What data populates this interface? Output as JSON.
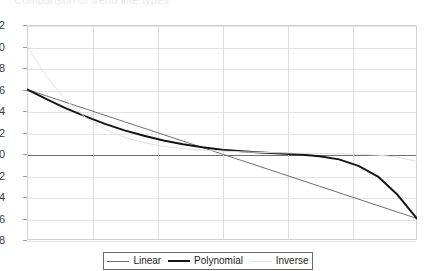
{
  "title": {
    "text": "Comparison of trend line types",
    "clipped": true
  },
  "legend": {
    "position": "bottom-center",
    "entries": [
      {
        "label": "Linear",
        "swatch": "linear-line-swatch",
        "color": "#6e6e72"
      },
      {
        "label": "Polynomial",
        "swatch": "poly-line-swatch",
        "color": "#151515"
      },
      {
        "label": "Inverse",
        "swatch": "inverse-line-swatch",
        "color": "#e2e2e6"
      }
    ]
  },
  "axis": {
    "y_ticks": [
      "12",
      "10",
      "8",
      "6",
      "4",
      "2",
      "0",
      "-2",
      "-4",
      "-6",
      "-8"
    ]
  },
  "chart_data": {
    "type": "line",
    "title": "Comparison of trend line types",
    "xlabel": "",
    "ylabel": "",
    "ylim": [
      -8,
      12
    ],
    "xlim": [
      0,
      6
    ],
    "ytick_step": 2,
    "yticks": [
      12,
      10,
      8,
      6,
      4,
      2,
      0,
      -2,
      -4,
      -6,
      -8
    ],
    "xticks": [
      0,
      1,
      2,
      3,
      4,
      5,
      6
    ],
    "xticklabels": [],
    "grid": "both",
    "zero_line": 0,
    "legend_position": "bottom-center",
    "x": [
      0,
      0.3,
      0.6,
      0.9,
      1.2,
      1.5,
      1.8,
      2.1,
      2.4,
      2.7,
      3.0,
      3.3,
      3.6,
      3.9,
      4.2,
      4.5,
      4.8,
      5.1,
      5.4,
      5.7,
      6.0
    ],
    "series": [
      {
        "name": "Linear",
        "color": "#6e6e72",
        "width": 1,
        "values": [
          6.0,
          5.4,
          4.8,
          4.2,
          3.6,
          3.0,
          2.4,
          1.8,
          1.2,
          0.6,
          0.0,
          -0.6,
          -1.2,
          -1.8,
          -2.4,
          -3.0,
          -3.6,
          -4.2,
          -4.8,
          -5.4,
          -6.0
        ]
      },
      {
        "name": "Polynomial",
        "color": "#151515",
        "width": 2,
        "values": [
          6.0,
          5.1,
          4.25,
          3.5,
          2.8,
          2.2,
          1.7,
          1.25,
          0.9,
          0.62,
          0.4,
          0.25,
          0.14,
          0.05,
          -0.05,
          -0.2,
          -0.5,
          -1.1,
          -2.1,
          -3.8,
          -6.0
        ]
      },
      {
        "name": "Inverse",
        "color": "#e2e2e6",
        "width": 1,
        "values": [
          10.0,
          7.2,
          5.0,
          3.4,
          2.3,
          1.55,
          1.05,
          0.72,
          0.5,
          0.36,
          0.27,
          0.2,
          0.15,
          0.11,
          0.08,
          0.05,
          0.02,
          -0.02,
          -0.1,
          -0.3,
          -0.7
        ]
      }
    ]
  }
}
